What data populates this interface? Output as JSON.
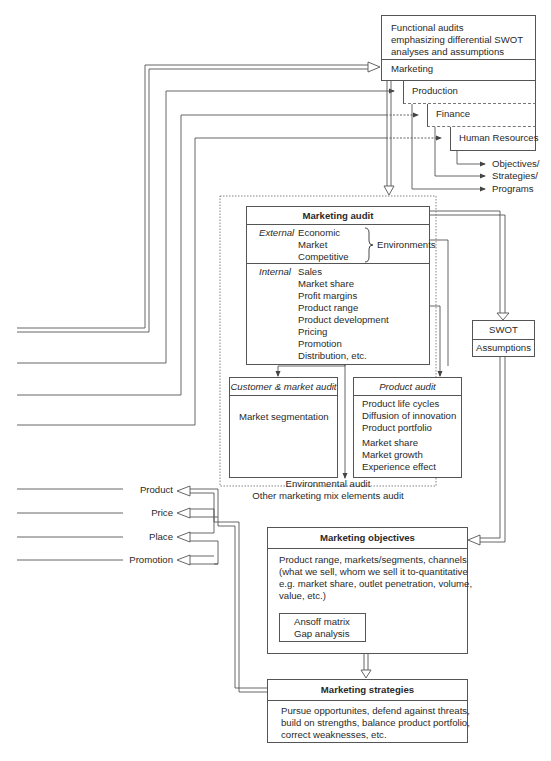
{
  "functional_audits": {
    "title_lines": [
      "Functional audits",
      "emphasizing differential SWOT",
      "analyses and assumptions"
    ],
    "marketing": "Marketing",
    "production": "Production",
    "finance": "Finance",
    "human_resources": "Human Resources",
    "outputs": [
      "Objectives/",
      "Strategies/",
      "Programs"
    ]
  },
  "marketing_audit": {
    "title": "Marketing audit",
    "external_label": "External",
    "external_items": [
      "Economic",
      "Market",
      "Competitive"
    ],
    "environments_label": "Environments",
    "internal_label": "Internal",
    "internal_items": [
      "Sales",
      "Market share",
      "Profit margins",
      "Product range",
      "Product development",
      "Pricing",
      "Promotion",
      "Distribution, etc."
    ]
  },
  "customer_market_audit": {
    "title": "Customer & market audit",
    "items": [
      "Market segmentation"
    ]
  },
  "product_audit": {
    "title": "Product audit",
    "items_group1": [
      "Product life cycles",
      "Diffusion of innovation",
      "Product portfolio"
    ],
    "items_group2": [
      "Market share",
      "Market growth",
      "Experience effect"
    ]
  },
  "audit_footer": [
    "Environmental audit",
    "Other marketing mix elements audit"
  ],
  "swot": {
    "title": "SWOT",
    "subtitle": "Assumptions"
  },
  "marketing_mix": [
    "Product",
    "Price",
    "Place",
    "Promotion"
  ],
  "marketing_objectives": {
    "title": "Marketing objectives",
    "body_lines": [
      "Product range, markets/segments, channels",
      "(what we sell, whom we sell it to-quantitative",
      "e.g. market share, outlet penetration, volume,",
      "value, etc.)"
    ],
    "tools": [
      "Ansoff matrix",
      "Gap analysis"
    ]
  },
  "marketing_strategies": {
    "title": "Marketing strategies",
    "body_lines": [
      "Pursue opportunites, defend against threats,",
      "build on strengths, balance product portfolio,",
      "correct weaknesses, etc."
    ]
  },
  "colors": {
    "line": "#555555",
    "text": "#2a2a2a",
    "background": "#ffffff"
  }
}
